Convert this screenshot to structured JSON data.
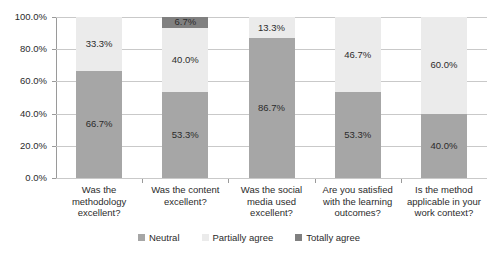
{
  "chart_data": {
    "type": "bar",
    "subtype": "stacked-100-percent",
    "title": "",
    "xlabel": "",
    "ylabel": "",
    "ylim": [
      0,
      100
    ],
    "ytick_labels": [
      "100.0%",
      "80.0%",
      "60.0%",
      "40.0%",
      "20.0%",
      "0.0%"
    ],
    "ytick_values": [
      100,
      80,
      60,
      40,
      20,
      0
    ],
    "grid": true,
    "legend_position": "bottom",
    "categories": [
      "Was the methodology excellent?",
      "Was the content excellent?",
      "Was the social media used excellent?",
      "Are you satisfied with the learning outcomes?",
      "Is the method applicable in your work context?"
    ],
    "category_lines": [
      [
        "Was the",
        "methodology",
        "excellent?"
      ],
      [
        "Was the content",
        "excellent?"
      ],
      [
        "Was the social",
        "media used",
        "excellent?"
      ],
      [
        "Are you satisfied",
        "with the learning",
        "outcomes?"
      ],
      [
        "Is the method",
        "applicable in your",
        "work context?"
      ]
    ],
    "series": [
      {
        "name": "Neutral",
        "color": "#a6a6a6",
        "values": [
          66.7,
          53.3,
          86.7,
          53.3,
          40.0
        ],
        "labels": [
          "66.7%",
          "53.3%",
          "86.7%",
          "53.3%",
          "40.0%"
        ]
      },
      {
        "name": "Partially agree",
        "color": "#ebebeb",
        "values": [
          33.3,
          40.0,
          13.3,
          46.7,
          60.0
        ],
        "labels": [
          "33.3%",
          "40.0%",
          "13.3%",
          "46.7%",
          "60.0%"
        ]
      },
      {
        "name": "Totally agree",
        "color": "#808080",
        "values": [
          0.0,
          6.7,
          0.0,
          0.0,
          0.0
        ],
        "labels": [
          "",
          "6.7%",
          "",
          "",
          ""
        ]
      }
    ]
  }
}
